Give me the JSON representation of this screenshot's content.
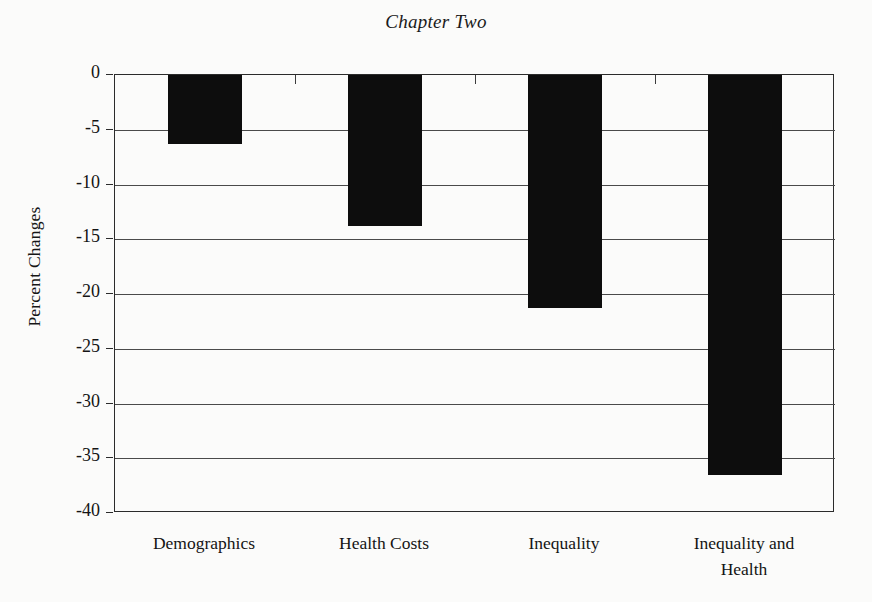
{
  "chart_data": {
    "type": "bar",
    "title": "Chapter Two",
    "xlabel": "",
    "ylabel": "Percent Changes",
    "categories": [
      "Demographics",
      "Health Costs",
      "Inequality",
      "Inequality and Health"
    ],
    "category_lines": [
      [
        "Demographics"
      ],
      [
        "Health Costs"
      ],
      [
        "Inequality"
      ],
      [
        "Inequality and",
        "Health"
      ]
    ],
    "values": [
      -6.3,
      -13.8,
      -21.3,
      -36.5
    ],
    "ylim": [
      -40,
      0
    ],
    "y_ticks": [
      0,
      -5,
      -10,
      -15,
      -20,
      -25,
      -30,
      -35,
      -40
    ],
    "y_tick_labels": [
      "0",
      "-5",
      "-10",
      "-15",
      "-20",
      "-25",
      "-30",
      "-35",
      "-40"
    ],
    "grid": true,
    "grid_axis": "y",
    "legend": false,
    "legend_position": "none",
    "orientation": "vertical",
    "bar_color": "#0d0d0d",
    "background_color": "#fbfbfa",
    "axis_color": "#2b2b2b"
  }
}
